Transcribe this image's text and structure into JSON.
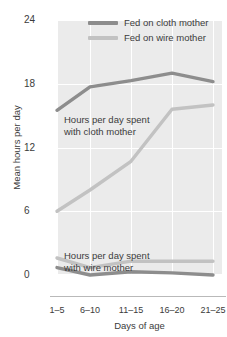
{
  "chart_data": {
    "type": "line",
    "title": "",
    "xlabel": "Days of age",
    "ylabel": "Mean hours per day",
    "categories": [
      "1–5",
      "6–10",
      "11–15",
      "16–20",
      "21–25"
    ],
    "ylim": [
      0,
      24
    ],
    "yticks": [
      0,
      6,
      12,
      18,
      24
    ],
    "ytick_labels": [
      "0",
      "6",
      "12",
      "18",
      "24"
    ],
    "grid": true,
    "legend_position": "top-right",
    "series": [
      {
        "name": "Fed on cloth mother",
        "color": "#8d8d8d",
        "measure": "hours per day spent with cloth mother",
        "values": [
          15.5,
          17.7,
          18.3,
          19.0,
          18.2
        ]
      },
      {
        "name": "Fed on wire mother",
        "color": "#c2c2c2",
        "measure": "hours per day spent with cloth mother",
        "values": [
          6.0,
          8.0,
          10.7,
          15.6,
          16.0
        ]
      },
      {
        "name": "Fed on cloth mother",
        "color": "#8d8d8d",
        "measure": "hours per day spent with wire mother",
        "values": [
          0.7,
          0.0,
          0.3,
          0.2,
          0.0
        ]
      },
      {
        "name": "Fed on wire mother",
        "color": "#c2c2c2",
        "measure": "hours per day spent with wire mother",
        "values": [
          1.6,
          0.7,
          1.3,
          1.3,
          1.3
        ]
      }
    ],
    "annotations": [
      {
        "id": "cloth",
        "line1": "Hours per day spent",
        "line2": "with cloth mother"
      },
      {
        "id": "wire",
        "line1": "Hours per day spent",
        "line2": "with wire mother"
      }
    ]
  },
  "legend": {
    "items": [
      {
        "label": "Fed on cloth mother",
        "color": "#8d8d8d"
      },
      {
        "label": "Fed on wire mother",
        "color": "#c2c2c2"
      }
    ]
  },
  "colors": {
    "plot_background": "#ebebeb",
    "gridline": "#ffffff",
    "text": "#3b3b3b",
    "axis": "#b9b9b9",
    "cloth_series": "#8d8d8d",
    "wire_series": "#c2c2c2"
  }
}
